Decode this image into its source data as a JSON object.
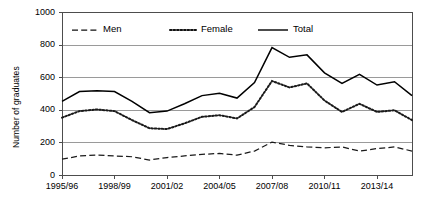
{
  "chart_data": {
    "type": "line",
    "title": "",
    "subtitle": "",
    "xlabel": "",
    "ylabel": "Number of graduates",
    "ylim": [
      0,
      1000
    ],
    "ytick_values": [
      0,
      200,
      400,
      600,
      800,
      1000
    ],
    "ytick_labels": [
      "0",
      "200",
      "400",
      "600",
      "800",
      "1000"
    ],
    "grid": "horizontal",
    "legend_position": "top-inside-left",
    "x": [
      "1995/96",
      "1996/97",
      "1997/98",
      "1998/99",
      "1999/00",
      "2000/01",
      "2001/02",
      "2002/03",
      "2003/04",
      "2004/05",
      "2005/06",
      "2006/07",
      "2007/08",
      "2008/09",
      "2009/10",
      "2010/11",
      "2011/12",
      "2012/13",
      "2013/14",
      "2014/15",
      "2015/16"
    ],
    "xtick_labels": [
      "1995/96",
      "1998/99",
      "2001/02",
      "2004/05",
      "2007/08",
      "2010/11",
      "2013/14"
    ],
    "xtick_indices": [
      0,
      3,
      6,
      9,
      12,
      15,
      18
    ],
    "series": [
      {
        "name": "Men",
        "style": "dashed",
        "color": "#1a1a1a",
        "values": [
          100,
          120,
          125,
          120,
          115,
          95,
          110,
          120,
          130,
          135,
          125,
          150,
          205,
          185,
          175,
          170,
          175,
          150,
          165,
          175,
          150
        ]
      },
      {
        "name": "Female",
        "style": "dotted",
        "color": "#1a1a1a",
        "values": [
          355,
          395,
          405,
          395,
          340,
          290,
          285,
          320,
          360,
          370,
          350,
          420,
          580,
          540,
          565,
          460,
          390,
          440,
          390,
          400,
          340
        ]
      },
      {
        "name": "Total",
        "style": "solid",
        "color": "#000000",
        "values": [
          455,
          515,
          520,
          515,
          455,
          385,
          395,
          440,
          490,
          505,
          475,
          570,
          785,
          725,
          740,
          630,
          565,
          620,
          555,
          575,
          490
        ]
      }
    ]
  },
  "legend": {
    "items": [
      {
        "label": "Men",
        "style": "dashed"
      },
      {
        "label": "Female",
        "style": "dotted"
      },
      {
        "label": "Total",
        "style": "solid"
      }
    ]
  },
  "axes": {
    "y_title": "Number of graduates"
  },
  "colors": {
    "grid": "#9a9a9a",
    "frame": "#4d4d4d",
    "line": "#111111",
    "background": "#ffffff"
  }
}
